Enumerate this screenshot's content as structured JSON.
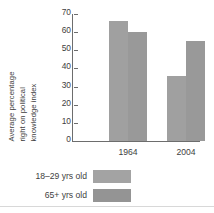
{
  "chart_data": {
    "type": "bar",
    "title": "",
    "subtitle": "",
    "xlabel": "",
    "ylabel": "Average percentage right on political knowledge index",
    "ylabel_lines": [
      "Average percentage",
      "right on political",
      "knowledge index"
    ],
    "categories": [
      "1964",
      "2004"
    ],
    "series": [
      {
        "name": "18–29 yrs old",
        "values": [
          66,
          36
        ],
        "color": "#a0a0a0"
      },
      {
        "name": "65+ yrs old",
        "values": [
          60,
          55
        ],
        "color": "#999999"
      }
    ],
    "ylim": [
      0,
      70
    ],
    "ytick_values": [
      0,
      10,
      20,
      30,
      40,
      50,
      60,
      70
    ],
    "ytick_labels": [
      "0",
      "10",
      "20",
      "30",
      "40",
      "50",
      "60",
      "70"
    ],
    "grid": false,
    "legend_position": "bottom-left"
  },
  "legend": {
    "entries": [
      {
        "label": "18–29 yrs old",
        "color": "#a3a3a3"
      },
      {
        "label": "65+ yrs old",
        "color": "#949494"
      }
    ]
  },
  "axis": {
    "line_color": "#6d6d6d"
  }
}
